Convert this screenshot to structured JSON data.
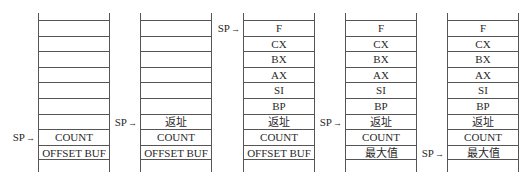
{
  "diagram": {
    "type": "stack-frames",
    "sp_label": "SP",
    "arrow": "→",
    "stacks": [
      {
        "cells": [
          "",
          "",
          "",
          "",
          "",
          "",
          "",
          "COUNT",
          "OFFSET BUF"
        ],
        "sp_index": 7
      },
      {
        "cells": [
          "",
          "",
          "",
          "",
          "",
          "",
          "返址",
          "COUNT",
          "OFFSET BUF"
        ],
        "sp_index": 6
      },
      {
        "cells": [
          "F",
          "CX",
          "BX",
          "AX",
          "SI",
          "BP",
          "返址",
          "COUNT",
          "OFFSET BUF"
        ],
        "sp_index": 0
      },
      {
        "cells": [
          "F",
          "CX",
          "BX",
          "AX",
          "SI",
          "BP",
          "返址",
          "COUNT",
          "最大值"
        ],
        "sp_index": 6
      },
      {
        "cells": [
          "F",
          "CX",
          "BX",
          "AX",
          "SI",
          "BP",
          "返址",
          "COUNT",
          "最大值"
        ],
        "sp_index": 8
      }
    ]
  }
}
